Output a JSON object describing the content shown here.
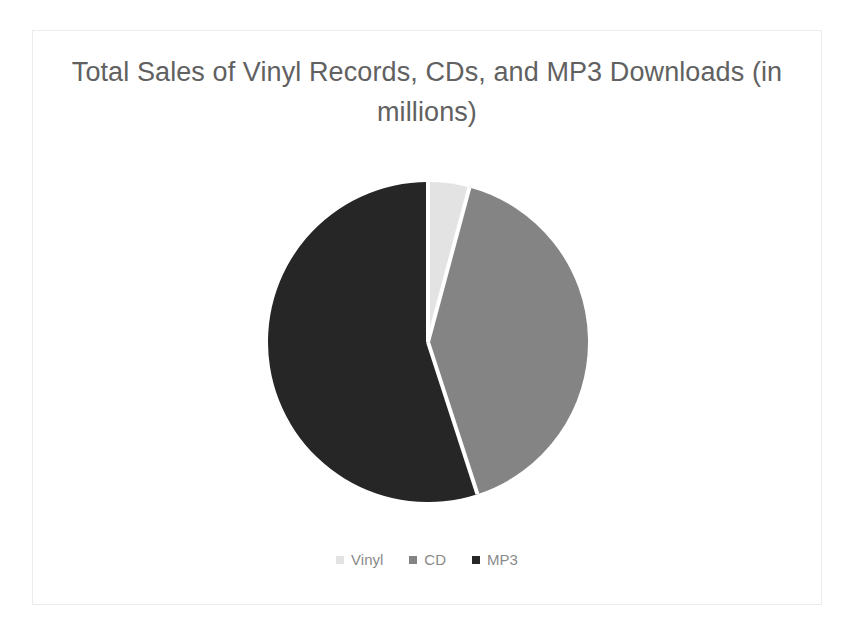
{
  "chart_data": {
    "type": "pie",
    "title": "Total Sales of Vinyl Records, CDs, and MP3 Downloads (in millions)",
    "title_line1": "Total Sales of Vinyl Records, CDs, and MP3",
    "title_line2": "Downloads (in millions)",
    "xlabel": "",
    "ylabel": "",
    "unit": "millions",
    "grid": false,
    "legend_position": "bottom",
    "start_angle_deg": 0,
    "direction": "clockwise",
    "categories": [
      "Vinyl",
      "CD",
      "MP3"
    ],
    "values": [
      15,
      145,
      195
    ],
    "percentages": [
      4.2,
      40.8,
      55.0
    ],
    "slice_angles_deg": [
      15,
      147,
      198
    ],
    "colors": [
      "#e3e3e3",
      "#848484",
      "#262626"
    ],
    "slices": [
      {
        "label": "Vinyl",
        "value": 15,
        "percent": 4.2,
        "color": "#e3e3e3",
        "start_deg": 0,
        "end_deg": 15
      },
      {
        "label": "CD",
        "value": 145,
        "percent": 40.8,
        "color": "#848484",
        "start_deg": 15,
        "end_deg": 162
      },
      {
        "label": "MP3",
        "value": 195,
        "percent": 55.0,
        "color": "#262626",
        "start_deg": 162,
        "end_deg": 360
      }
    ]
  },
  "legend": {
    "items": [
      {
        "label": "Vinyl",
        "color": "#e3e3e3"
      },
      {
        "label": "CD",
        "color": "#848484"
      },
      {
        "label": "MP3",
        "color": "#262626"
      }
    ]
  },
  "style": {
    "title_color": "#616161",
    "legend_text_color": "#8a8a8a",
    "frame_color": "#ececec",
    "background": "#ffffff",
    "slice_separator_color": "#ffffff"
  }
}
